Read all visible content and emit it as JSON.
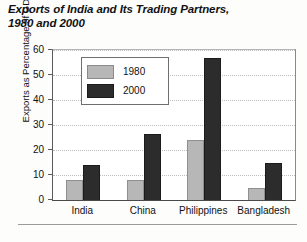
{
  "chart_data": {
    "type": "bar",
    "title": "Exports of India and Its Trading Partners,\n1980 and 2000",
    "xlabel": "",
    "ylabel": "Exports as Percentage of GDP",
    "categories": [
      "India",
      "China",
      "Philippines",
      "Bangladesh"
    ],
    "series": [
      {
        "name": "1980",
        "color": "#b7b7b7",
        "values": [
          8,
          8,
          24,
          5
        ]
      },
      {
        "name": "2000",
        "color": "#2c2c2c",
        "values": [
          14,
          26.5,
          57,
          15
        ]
      }
    ],
    "ylim": [
      0,
      60
    ],
    "yticks": [
      0,
      10,
      20,
      30,
      40,
      50,
      60
    ],
    "ytick_labels": [
      "0",
      "10",
      "20",
      "30",
      "40",
      "50",
      "60"
    ],
    "grid": true,
    "grid_axis": "y",
    "legend_position": "upper-left-inside"
  }
}
